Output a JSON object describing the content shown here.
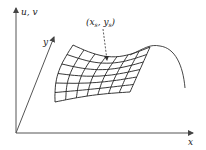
{
  "diagram": {
    "axes": {
      "vertical_label": "u, v",
      "depth_label": "y",
      "horizontal_label": "x"
    },
    "annotation": {
      "point_label": "(x_s, y_s)",
      "point_label_display": "(xs, ys)",
      "style": "dashed arrow pointing to saddle point on mesh"
    },
    "mesh": {
      "rows": 6,
      "cols": 7,
      "description": "curved grid surface patch with saddle shape, extending into an arched edge on the right"
    },
    "colors": {
      "line": "#222222",
      "axis": "#555555",
      "background": "#ffffff"
    }
  }
}
